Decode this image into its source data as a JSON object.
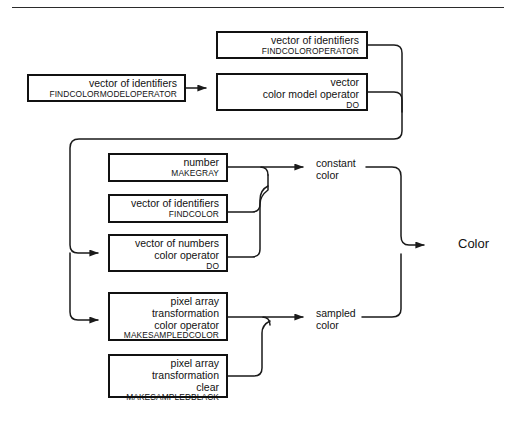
{
  "figure": {
    "kind": "syntax-flow-diagram",
    "subject": "Color",
    "divider": "horizontal-rule"
  },
  "nodes": [
    {
      "id": "findcoloroperator",
      "type": "vector of identifiers",
      "operator": "FINDCOLOROPERATOR",
      "has_input_arrow": false,
      "lines": [
        "vector of identifiers"
      ],
      "x": 216,
      "y": 31,
      "w": 152,
      "h": 28
    },
    {
      "id": "findcolormodeloperator",
      "type": "vector of identifiers",
      "operator": "FINDCOLORMODELOPERATOR",
      "has_input_arrow": false,
      "lines": [
        "vector of identifiers"
      ],
      "x": 27,
      "y": 74,
      "w": 159,
      "h": 28
    },
    {
      "id": "colormodeloperator-do",
      "type": "vector / color model operator",
      "operator": "DO",
      "has_input_arrow": true,
      "lines": [
        "vector",
        "color model operator"
      ],
      "x": 216,
      "y": 73,
      "w": 152,
      "h": 38
    },
    {
      "id": "makegray",
      "type": "number",
      "operator": "MAKEGRAY",
      "has_input_arrow": false,
      "lines": [
        "number"
      ],
      "x": 108,
      "y": 153,
      "w": 120,
      "h": 29
    },
    {
      "id": "findcolor",
      "type": "vector of identifiers",
      "operator": "FINDCOLOR",
      "has_input_arrow": false,
      "lines": [
        "vector of identifiers"
      ],
      "x": 108,
      "y": 194,
      "w": 120,
      "h": 29
    },
    {
      "id": "coloroperator-do",
      "type": "vector of numbers / color operator",
      "operator": "DO",
      "has_input_arrow": true,
      "lines": [
        "vector of numbers",
        "color operator"
      ],
      "x": 108,
      "y": 234,
      "w": 120,
      "h": 38
    },
    {
      "id": "makesampledcolor",
      "type": "pixel array transformation color operator",
      "operator": "MAKESAMPLEDCOLOR",
      "has_input_arrow": true,
      "lines": [
        "pixel array",
        "transformation",
        "color operator"
      ],
      "x": 108,
      "y": 292,
      "w": 120,
      "h": 49
    },
    {
      "id": "makesampledblack",
      "type": "pixel array transformation clear",
      "operator": "MAKESAMPLEDBLACK",
      "has_input_arrow": false,
      "lines": [
        "pixel array",
        "transformation",
        "clear"
      ],
      "x": 108,
      "y": 354,
      "w": 120,
      "h": 44
    }
  ],
  "labels": {
    "constant_color": {
      "line1": "constant",
      "line2": "color",
      "x": 316,
      "y": 158
    },
    "sampled_color": {
      "line1": "sampled",
      "line2": "color",
      "x": 316,
      "y": 308
    },
    "output": {
      "text": "Color",
      "x": 458,
      "y": 236
    }
  },
  "colors": {
    "ink": "#121212",
    "box_border": "#111111",
    "wire": "#1a1a1a",
    "paper": "#ffffff",
    "rule": "#2b2b2b"
  }
}
